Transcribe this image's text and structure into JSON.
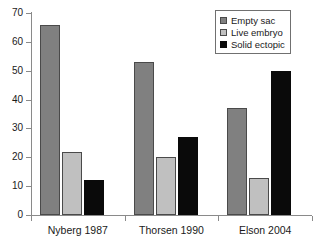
{
  "chart_data": {
    "type": "bar",
    "title": "",
    "subtitle": "",
    "xlabel": "",
    "ylabel": "",
    "ylim": [
      0,
      70
    ],
    "ytick_step": 10,
    "yticks": [
      "0",
      "10",
      "20",
      "30",
      "40",
      "50",
      "60",
      "70"
    ],
    "grid": false,
    "legend_position": "top-right",
    "categories": [
      "Nyberg 1987",
      "Thorsen 1990",
      "Elson 2004"
    ],
    "series": [
      {
        "name": "Empty sac",
        "color": "#808080",
        "values": [
          66,
          53,
          37
        ]
      },
      {
        "name": "Live embryo",
        "color": "#c0c0c0",
        "values": [
          22,
          20,
          13
        ]
      },
      {
        "name": "Solid ectopic",
        "color": "#0a0a0a",
        "values": [
          12,
          27,
          50
        ]
      }
    ]
  },
  "legend": {
    "items": [
      {
        "label": "Empty sac"
      },
      {
        "label": "Live embryo"
      },
      {
        "label": "Solid ectopic"
      }
    ]
  },
  "axis": {
    "y_labels": [
      "70",
      "60",
      "50",
      "40",
      "30",
      "20",
      "10",
      "0"
    ],
    "x_labels": [
      "Nyberg 1987",
      "Thorsen 1990",
      "Elson 2004"
    ]
  },
  "colors": {
    "series_empty_sac": "#808080",
    "series_live_embryo": "#c0c0c0",
    "series_solid_ectopic": "#0a0a0a",
    "axis": "#8a8a8a",
    "text": "#1a1a1a",
    "background": "#ffffff"
  }
}
